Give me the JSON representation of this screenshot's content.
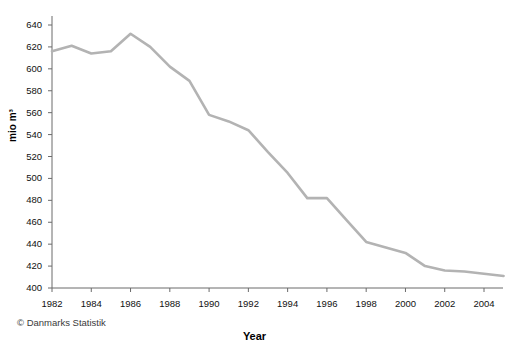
{
  "chart_data": {
    "type": "line",
    "title": "",
    "subtitle": "",
    "xlabel": "Year",
    "ylabel": "mio m³",
    "xlim": [
      1982,
      2005
    ],
    "ylim": [
      400,
      645
    ],
    "ytick_step": 20,
    "xtick_step": 2,
    "grid": false,
    "legend": "none",
    "line_color": "#b3b3b3",
    "axis_color": "#6b6b6b",
    "x": [
      1982,
      1983,
      1984,
      1985,
      1986,
      1987,
      1988,
      1989,
      1990,
      1991,
      1992,
      1993,
      1994,
      1995,
      1996,
      1997,
      1998,
      1999,
      2000,
      2001,
      2002,
      2003,
      2004,
      2005
    ],
    "series": [
      {
        "name": "mio m³",
        "values": [
          616,
          621,
          614,
          616,
          632,
          620,
          602,
          589,
          558,
          552,
          544,
          524,
          505,
          482,
          482,
          462,
          442,
          437,
          432,
          420,
          416,
          415,
          413,
          411
        ]
      }
    ],
    "ytick_labels": [
      "400",
      "420",
      "440",
      "460",
      "480",
      "500",
      "520",
      "540",
      "560",
      "580",
      "600",
      "620",
      "640"
    ],
    "ytick_values": [
      400,
      420,
      440,
      460,
      480,
      500,
      520,
      540,
      560,
      580,
      600,
      620,
      640
    ],
    "xtick_labels": [
      "1982",
      "1984",
      "1986",
      "1988",
      "1990",
      "1992",
      "1994",
      "1996",
      "1998",
      "2000",
      "2002",
      "2004"
    ],
    "xtick_values": [
      1982,
      1984,
      1986,
      1988,
      1990,
      1992,
      1994,
      1996,
      1998,
      2000,
      2002,
      2004
    ],
    "annotations": [
      {
        "name": "credit",
        "text": "© Danmarks Statistik"
      }
    ]
  },
  "labels": {
    "y_axis_title": "mio m³",
    "x_axis_title": "Year",
    "credit": "© Danmarks Statistik"
  }
}
